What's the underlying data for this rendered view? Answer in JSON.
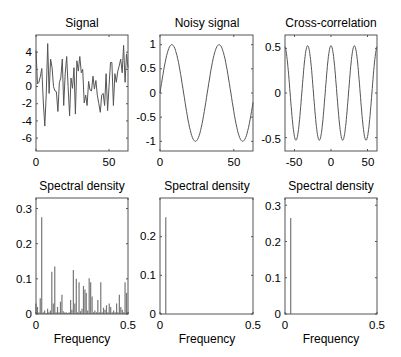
{
  "figure": {
    "background": "#ffffff",
    "line_color": "#555555",
    "axis_color": "#555555"
  },
  "chart_data": [
    {
      "id": "signal",
      "type": "line",
      "title": "Signal",
      "xlabel": "",
      "ylabel": "",
      "xlim": [
        0,
        63
      ],
      "ylim": [
        -7.5,
        6
      ],
      "xticks": [
        0,
        50
      ],
      "yticks": [
        4,
        2,
        0,
        -2,
        -4,
        -6
      ],
      "grid": false,
      "x": [
        0,
        1,
        2,
        3,
        4,
        5,
        6,
        7,
        8,
        9,
        10,
        11,
        12,
        13,
        14,
        15,
        16,
        17,
        18,
        19,
        20,
        21,
        22,
        23,
        24,
        25,
        26,
        27,
        28,
        29,
        30,
        31,
        32,
        33,
        34,
        35,
        36,
        37,
        38,
        39,
        40,
        41,
        42,
        43,
        44,
        45,
        46,
        47,
        48,
        49,
        50,
        51,
        52,
        53,
        54,
        55,
        56,
        57,
        58,
        59,
        60,
        61,
        62,
        63
      ],
      "values": [
        4.2,
        0.3,
        0.5,
        1.2,
        2.1,
        -1.8,
        -4.6,
        -1.0,
        5.0,
        -0.8,
        3.2,
        2.2,
        0.0,
        -0.5,
        -0.6,
        -2.9,
        0.5,
        1.0,
        3.2,
        -2.2,
        1.5,
        3.5,
        0.0,
        -3.4,
        1.0,
        -0.2,
        2.2,
        -3.2,
        3.0,
        1.8,
        3.5,
        1.6,
        2.0,
        -1.9,
        -1.0,
        -2.2,
        0.6,
        -0.4,
        -0.5,
        1.2,
        -0.3,
        0.7,
        -1.0,
        -2.0,
        -3.0,
        -1.0,
        -0.8,
        -2.2,
        1.5,
        -2.8,
        0.0,
        2.8,
        2.8,
        -2.2,
        1.5,
        0.5,
        1.8,
        2.4,
        3.2,
        1.6,
        4.8,
        0.5,
        3.8,
        2.2
      ]
    },
    {
      "id": "noisy-signal",
      "type": "line",
      "title": "Noisy signal",
      "xlabel": "",
      "ylabel": "",
      "xlim": [
        0,
        63
      ],
      "ylim": [
        -1.2,
        1.2
      ],
      "xticks": [
        0,
        50
      ],
      "yticks": [
        1,
        0.5,
        0,
        -0.5,
        -1
      ],
      "grid": false,
      "function": "sin(2*pi*x/32)",
      "period": 32,
      "amplitude": 1
    },
    {
      "id": "cross-correlation",
      "type": "line",
      "title": "Cross-correlation",
      "xlabel": "",
      "ylabel": "",
      "xlim": [
        -63,
        63
      ],
      "ylim": [
        -0.65,
        0.65
      ],
      "xticks": [
        -50,
        0,
        50
      ],
      "yticks": [
        0.5,
        0,
        -0.5
      ],
      "grid": false,
      "function": "0.53*cos(2*pi*x/32)",
      "period": 32,
      "amplitude": 0.53
    },
    {
      "id": "spectral-density-1",
      "type": "bar",
      "title": "Spectral density",
      "xlabel": "Frequency",
      "ylabel": "",
      "xlim": [
        0,
        0.5
      ],
      "ylim": [
        0,
        0.33
      ],
      "xticks": [
        0,
        0.5
      ],
      "xticklabels": [
        "0",
        "0.5"
      ],
      "yticks": [
        0,
        0.1,
        0.2,
        0.3
      ],
      "grid": false,
      "x": [
        0.0,
        0.008,
        0.016,
        0.023,
        0.031,
        0.039,
        0.047,
        0.055,
        0.063,
        0.07,
        0.078,
        0.086,
        0.094,
        0.102,
        0.109,
        0.117,
        0.125,
        0.133,
        0.141,
        0.148,
        0.156,
        0.164,
        0.172,
        0.18,
        0.188,
        0.195,
        0.203,
        0.211,
        0.219,
        0.227,
        0.234,
        0.242,
        0.25,
        0.258,
        0.266,
        0.273,
        0.281,
        0.289,
        0.297,
        0.305,
        0.313,
        0.32,
        0.328,
        0.336,
        0.344,
        0.352,
        0.359,
        0.367,
        0.375,
        0.383,
        0.391,
        0.398,
        0.406,
        0.414,
        0.422,
        0.43,
        0.438,
        0.445,
        0.453,
        0.461,
        0.469,
        0.477,
        0.484,
        0.492,
        0.5
      ],
      "values": [
        0.03,
        0.02,
        0.005,
        0.045,
        0.275,
        0.005,
        0.01,
        0.003,
        0.015,
        0.005,
        0.01,
        0.12,
        0.03,
        0.135,
        0.005,
        0.02,
        0.005,
        0.035,
        0.055,
        0.008,
        0.004,
        0.005,
        0.003,
        0.005,
        0.04,
        0.012,
        0.125,
        0.03,
        0.1,
        0.005,
        0.09,
        0.008,
        0.015,
        0.08,
        0.07,
        0.06,
        0.01,
        0.102,
        0.09,
        0.05,
        0.005,
        0.01,
        0.005,
        0.04,
        0.005,
        0.09,
        0.005,
        0.018,
        0.012,
        0.025,
        0.005,
        0.03,
        0.02,
        0.005,
        0.01,
        0.005,
        0.03,
        0.005,
        0.055,
        0.02,
        0.012,
        0.005,
        0.09,
        0.06,
        0.005
      ]
    },
    {
      "id": "spectral-density-2",
      "type": "bar",
      "title": "Spectral density",
      "xlabel": "Frequency",
      "ylabel": "",
      "xlim": [
        0,
        0.5
      ],
      "ylim": [
        0,
        0.3
      ],
      "xticks": [
        0,
        0.5
      ],
      "xticklabels": [
        "0",
        "0.5"
      ],
      "yticks": [
        0,
        0.1,
        0.2
      ],
      "grid": false,
      "x": [
        0.031
      ],
      "values": [
        0.25
      ]
    },
    {
      "id": "spectral-density-3",
      "type": "bar",
      "title": "Spectral density",
      "xlabel": "Frequency",
      "ylabel": "",
      "xlim": [
        0,
        0.5
      ],
      "ylim": [
        0,
        0.32
      ],
      "xticks": [
        0,
        0.5
      ],
      "xticklabels": [
        "0",
        "0.5"
      ],
      "yticks": [
        0,
        0.1,
        0.2,
        0.3
      ],
      "grid": false,
      "x": [
        0.031
      ],
      "values": [
        0.265
      ]
    }
  ],
  "panels": [
    {
      "title": "Signal",
      "xlabel": "",
      "xticklabels": [
        "0",
        "50"
      ],
      "yticklabels": [
        "4",
        "2",
        "0",
        "-2",
        "-4",
        "-6"
      ]
    },
    {
      "title": "Noisy signal",
      "xlabel": "",
      "xticklabels": [
        "0",
        "50"
      ],
      "yticklabels": [
        "1",
        "0.5",
        "0",
        "-0.5",
        "-1"
      ]
    },
    {
      "title": "Cross-correlation",
      "xlabel": "",
      "xticklabels": [
        "-50",
        "0",
        "50"
      ],
      "yticklabels": [
        "0.5",
        "0",
        "-0.5"
      ]
    },
    {
      "title": "Spectral density",
      "xlabel": "Frequency",
      "xticklabels": [
        "0",
        "0.5"
      ],
      "yticklabels": [
        "0",
        "0.1",
        "0.2",
        "0.3"
      ]
    },
    {
      "title": "Spectral density",
      "xlabel": "Frequency",
      "xticklabels": [
        "0",
        "0.5"
      ],
      "yticklabels": [
        "0",
        "0.1",
        "0.2"
      ]
    },
    {
      "title": "Spectral density",
      "xlabel": "Frequency",
      "xticklabels": [
        "0",
        "0.5"
      ],
      "yticklabels": [
        "0",
        "0.1",
        "0.2",
        "0.3"
      ]
    }
  ]
}
